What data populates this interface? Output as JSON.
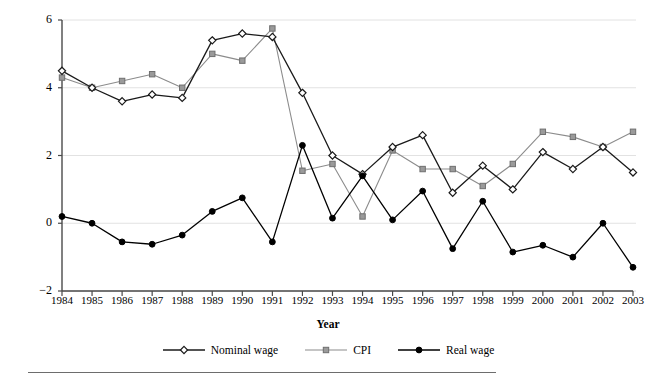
{
  "chart_data": {
    "type": "line",
    "title": "",
    "xlabel": "Year",
    "ylabel": "Annual percentage change",
    "categories": [
      "1984",
      "1985",
      "1986",
      "1987",
      "1988",
      "1989",
      "1990",
      "1991",
      "1992",
      "1993",
      "1994",
      "1995",
      "1996",
      "1997",
      "1998",
      "1999",
      "2000",
      "2001",
      "2002",
      "2003"
    ],
    "x": [
      1984,
      1985,
      1986,
      1987,
      1988,
      1989,
      1990,
      1991,
      1992,
      1993,
      1994,
      1995,
      1996,
      1997,
      1998,
      1999,
      2000,
      2001,
      2002,
      2003
    ],
    "xlim": [
      1984,
      2003
    ],
    "ylim": [
      -2,
      6
    ],
    "yticks": [
      -2,
      0,
      2,
      4,
      6
    ],
    "ytick_labels": [
      "−2",
      "0",
      "2",
      "4",
      "6"
    ],
    "grid": true,
    "grid_axis": "y",
    "legend_position": "bottom",
    "series": [
      {
        "name": "Nominal wage",
        "marker": "diamond-open",
        "color": "#1a1a1a",
        "values": [
          4.5,
          4.0,
          3.6,
          3.8,
          3.7,
          5.4,
          5.6,
          5.5,
          3.85,
          2.0,
          1.45,
          2.25,
          2.6,
          0.9,
          1.7,
          1.0,
          2.1,
          1.6,
          2.25,
          1.5
        ]
      },
      {
        "name": "CPI",
        "marker": "square-filled",
        "color": "#8c8c8c",
        "values": [
          4.3,
          4.0,
          4.2,
          4.4,
          4.0,
          5.0,
          4.8,
          5.75,
          1.55,
          1.75,
          0.2,
          2.15,
          1.6,
          1.6,
          1.1,
          1.75,
          2.7,
          2.55,
          2.25,
          2.7
        ]
      },
      {
        "name": "Real wage",
        "marker": "circle-filled",
        "color": "#000000",
        "values": [
          0.2,
          0.0,
          -0.55,
          -0.62,
          -0.35,
          0.35,
          0.75,
          -0.55,
          2.3,
          0.15,
          1.4,
          0.1,
          0.95,
          -0.75,
          0.65,
          -0.85,
          -0.65,
          -1.0,
          0.0,
          -1.3
        ]
      }
    ]
  },
  "legend": {
    "items": [
      {
        "label": "Nominal wage",
        "marker": "diamond-open",
        "color": "#1a1a1a"
      },
      {
        "label": "CPI",
        "marker": "square-filled",
        "color": "#8c8c8c"
      },
      {
        "label": "Real wage",
        "marker": "circle-filled",
        "color": "#000000"
      }
    ]
  },
  "axes": {
    "ylabel": "Annual percentage change",
    "xlabel": "Year"
  }
}
